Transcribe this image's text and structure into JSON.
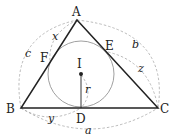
{
  "diagram": {
    "colors": {
      "stroke": "#222222",
      "circle": "#888888",
      "dashed": "#aaaaaa",
      "background": "#ffffff"
    },
    "points": {
      "A": {
        "label": "A",
        "x": 77,
        "y": 20
      },
      "B": {
        "label": "B",
        "x": 21,
        "y": 108
      },
      "C": {
        "label": "C",
        "x": 158,
        "y": 108
      },
      "D": {
        "label": "D",
        "x": 81,
        "y": 108
      },
      "E": {
        "label": "E",
        "x": 108,
        "y": 52
      },
      "F": {
        "label": "F",
        "x": 50,
        "y": 61
      },
      "I": {
        "label": "I",
        "x": 81,
        "y": 74
      }
    },
    "incircle": {
      "center": "I",
      "radius": 33
    },
    "lengths": {
      "a": "a",
      "b": "b",
      "c": "c",
      "x": "x",
      "y": "y",
      "z": "z",
      "r": "r"
    }
  }
}
